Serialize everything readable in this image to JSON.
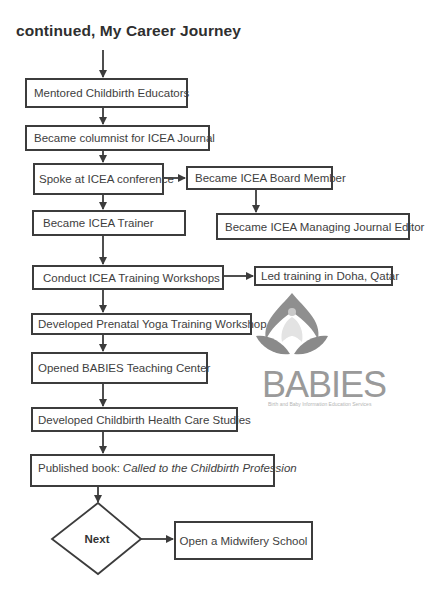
{
  "title": "continued, My Career Journey",
  "flowchart": {
    "main_steps": [
      {
        "id": "mentored",
        "label": "Mentored Childbirth Educators"
      },
      {
        "id": "columnist",
        "label": "Became columnist for ICEA Journal"
      },
      {
        "id": "spoke",
        "label": "Spoke at ICEA conference"
      },
      {
        "id": "trainer",
        "label": "Became ICEA Trainer"
      },
      {
        "id": "workshops",
        "label": "Conduct ICEA Training Workshops"
      },
      {
        "id": "yoga",
        "label": "Developed Prenatal Yoga Training Workshop"
      },
      {
        "id": "babies_center",
        "label": "Opened BABIES Teaching Center"
      },
      {
        "id": "health_care",
        "label": "Developed Childbirth Health Care Studies"
      },
      {
        "id": "published",
        "label_prefix": "Published book:",
        "label_italic": "Called to the Childbirth Profession"
      }
    ],
    "branches": [
      {
        "id": "board_member",
        "label": "Became ICEA Board Member",
        "from": "spoke"
      },
      {
        "id": "managing_editor",
        "label": "Became ICEA Managing Journal Editor",
        "from": "board_member"
      },
      {
        "id": "doha",
        "label": "Led training in Doha, Qatar",
        "from": "workshops"
      }
    ],
    "decision": {
      "id": "next",
      "label": "Next"
    },
    "final": {
      "id": "midwifery",
      "label": "Open a Midwifery School",
      "from": "next"
    }
  },
  "logo": {
    "wordmark": "BABIES",
    "tagline": "Birth and Baby Information Education Services",
    "color": "#9a9a9a"
  },
  "colors": {
    "line": "#3c3c3c",
    "text": "#3e3e3e",
    "background": "#ffffff"
  }
}
